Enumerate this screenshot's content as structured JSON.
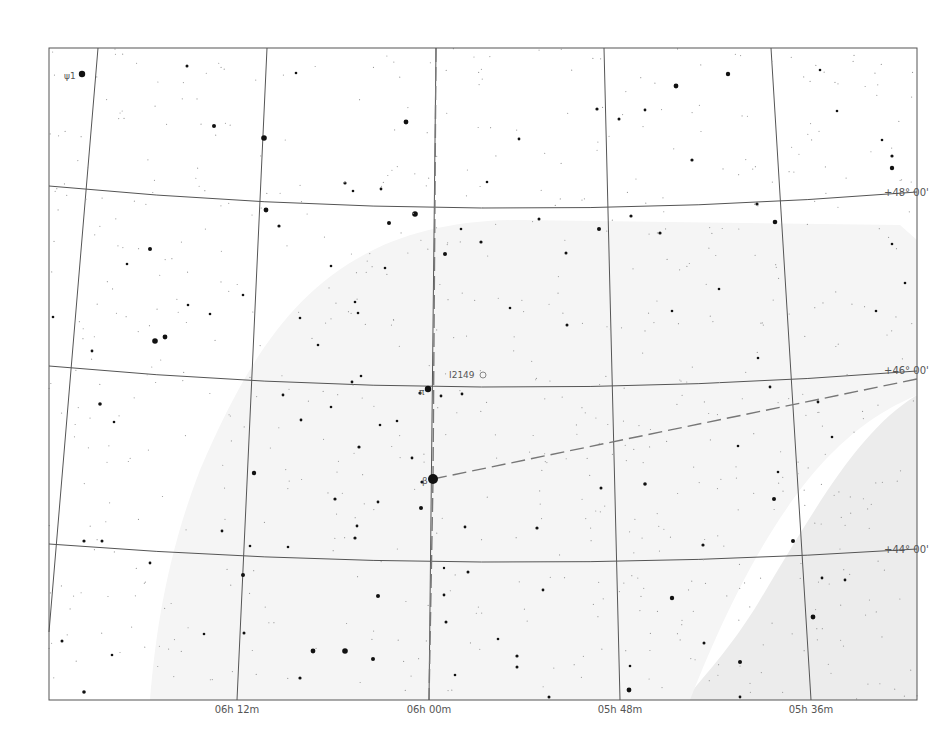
{
  "chart": {
    "frame": {
      "x": 49,
      "y": 48,
      "width": 868,
      "height": 652
    },
    "colors": {
      "background": "#ffffff",
      "milky_way": "#ececec",
      "milky_way_faint": "#f5f5f5",
      "grid": "#555555",
      "constellation": "#777777",
      "star": "#111111",
      "label": "#555555"
    },
    "ra_lines": [
      {
        "label": "06h 12m",
        "top": [
          98,
          48
        ],
        "bottom": [
          64,
          64
        ],
        "label_x": 237,
        "bx": 237
      },
      {
        "label": "",
        "top": [
          98,
          48
        ],
        "bottom": [
          49,
          632
        ]
      },
      {
        "label": "06h 12m",
        "top": [
          267,
          48
        ],
        "bottom": [
          237,
          700
        ]
      },
      {
        "label": "06h 00m",
        "top": [
          436,
          48
        ],
        "bottom": [
          429,
          700
        ]
      },
      {
        "label": "05h 48m",
        "top": [
          604,
          48
        ],
        "bottom": [
          620,
          700
        ]
      },
      {
        "label": "05h 36m",
        "top": [
          771,
          48
        ],
        "bottom": [
          811,
          700
        ]
      }
    ],
    "ra_labels": [
      {
        "text": "06h 12m",
        "x": 237,
        "y": 713
      },
      {
        "text": "06h 00m",
        "x": 429,
        "y": 713
      },
      {
        "text": "05h 48m",
        "x": 620,
        "y": 713
      },
      {
        "text": "05h 36m",
        "x": 811,
        "y": 713
      }
    ],
    "dec_lines": [
      {
        "label": "+48° 00'",
        "left_y": 186,
        "mid_y": 208,
        "right_y": 192
      },
      {
        "label": "+46° 00'",
        "left_y": 366,
        "mid_y": 387,
        "right_y": 371
      },
      {
        "label": "+44° 00'",
        "left_y": 544,
        "mid_y": 562,
        "right_y": 549
      }
    ],
    "dec_labels": [
      {
        "text": "+48° 00'",
        "x": 884,
        "y": 196
      },
      {
        "text": "+46° 00'",
        "x": 884,
        "y": 374
      },
      {
        "text": "+44° 00'",
        "x": 884,
        "y": 553
      }
    ],
    "object_labels": [
      {
        "name": "star-label-psi1",
        "text": "ψ1",
        "x": 64,
        "y": 79
      },
      {
        "name": "star-label-beta",
        "text": "β",
        "x": 422,
        "y": 484
      },
      {
        "name": "star-label-pi",
        "text": "π",
        "x": 419,
        "y": 395
      },
      {
        "name": "dso-label-ic2149",
        "text": "I2149",
        "x": 449,
        "y": 378
      }
    ],
    "constellation_line": {
      "from": [
        433,
        479
      ],
      "to": [
        917,
        379
      ]
    },
    "stars": [
      [
        82,
        74,
        3.2
      ],
      [
        264,
        138,
        2.8
      ],
      [
        214,
        126,
        2.0
      ],
      [
        187,
        66,
        1.5
      ],
      [
        406,
        122,
        2.4
      ],
      [
        345,
        183,
        1.6
      ],
      [
        296,
        73,
        1.3
      ],
      [
        150,
        249,
        2.0
      ],
      [
        155,
        341,
        2.8
      ],
      [
        165,
        337,
        2.4
      ],
      [
        92,
        351,
        1.4
      ],
      [
        266,
        210,
        2.4
      ],
      [
        279,
        226,
        1.6
      ],
      [
        389,
        223,
        2.0
      ],
      [
        415,
        214,
        2.8
      ],
      [
        445,
        254,
        2.0
      ],
      [
        481,
        242,
        1.6
      ],
      [
        566,
        253,
        1.5
      ],
      [
        599,
        229,
        2.0
      ],
      [
        676,
        86,
        2.4
      ],
      [
        728,
        74,
        2.2
      ],
      [
        692,
        160,
        1.6
      ],
      [
        619,
        119,
        1.5
      ],
      [
        892,
        156,
        1.6
      ],
      [
        892,
        168,
        2.2
      ],
      [
        660,
        233,
        1.6
      ],
      [
        775,
        222,
        2.3
      ],
      [
        757,
        204,
        1.6
      ],
      [
        631,
        216,
        1.6
      ],
      [
        539,
        219,
        1.5
      ],
      [
        428,
        389,
        3.2
      ],
      [
        420,
        393,
        1.6
      ],
      [
        441,
        396,
        1.4
      ],
      [
        462,
        394,
        1.4
      ],
      [
        433,
        479,
        5.0
      ],
      [
        100,
        404,
        1.8
      ],
      [
        254,
        473,
        2.2
      ],
      [
        301,
        420,
        1.4
      ],
      [
        359,
        447,
        1.6
      ],
      [
        412,
        458,
        1.4
      ],
      [
        422,
        482,
        1.6
      ],
      [
        421,
        508,
        2.0
      ],
      [
        537,
        528,
        1.6
      ],
      [
        601,
        488,
        1.5
      ],
      [
        645,
        484,
        1.8
      ],
      [
        672,
        598,
        2.2
      ],
      [
        704,
        643,
        1.5
      ],
      [
        774,
        499,
        2.0
      ],
      [
        793,
        541,
        2.0
      ],
      [
        813,
        617,
        2.4
      ],
      [
        740,
        662,
        2.0
      ],
      [
        845,
        580,
        1.4
      ],
      [
        629,
        690,
        2.4
      ],
      [
        549,
        697,
        1.5
      ],
      [
        517,
        656,
        1.6
      ],
      [
        465,
        527,
        1.4
      ],
      [
        378,
        596,
        2.0
      ],
      [
        373,
        659,
        2.0
      ],
      [
        345,
        651,
        2.8
      ],
      [
        313,
        651,
        2.4
      ],
      [
        300,
        678,
        1.6
      ],
      [
        243,
        575,
        2.0
      ],
      [
        244,
        633,
        1.5
      ],
      [
        84,
        541,
        1.6
      ],
      [
        84,
        692,
        1.8
      ],
      [
        102,
        541,
        1.5
      ],
      [
        62,
        641,
        1.5
      ],
      [
        112,
        655,
        1.3
      ],
      [
        335,
        499,
        1.6
      ],
      [
        355,
        538,
        1.6
      ],
      [
        357,
        526,
        1.4
      ],
      [
        378,
        502,
        1.4
      ],
      [
        468,
        572,
        1.5
      ],
      [
        444,
        595,
        1.4
      ],
      [
        444,
        568,
        1.2
      ],
      [
        446,
        622,
        1.5
      ],
      [
        455,
        675,
        1.3
      ],
      [
        517,
        667,
        1.5
      ],
      [
        498,
        639,
        1.3
      ],
      [
        543,
        590,
        1.4
      ],
      [
        630,
        666,
        1.3
      ],
      [
        703,
        545,
        1.6
      ],
      [
        740,
        697,
        1.4
      ],
      [
        822,
        578,
        1.4
      ],
      [
        892,
        244,
        1.3
      ],
      [
        905,
        283,
        1.3
      ],
      [
        882,
        140,
        1.3
      ],
      [
        837,
        111,
        1.3
      ],
      [
        820,
        70,
        1.3
      ],
      [
        645,
        110,
        1.4
      ],
      [
        597,
        109,
        1.6
      ],
      [
        519,
        139,
        1.4
      ],
      [
        487,
        182,
        1.3
      ],
      [
        381,
        189,
        1.4
      ],
      [
        353,
        191,
        1.3
      ],
      [
        331,
        266,
        1.3
      ],
      [
        358,
        313,
        1.3
      ],
      [
        461,
        229,
        1.3
      ],
      [
        510,
        308,
        1.3
      ],
      [
        567,
        325,
        1.5
      ],
      [
        672,
        311,
        1.3
      ],
      [
        719,
        289,
        1.3
      ],
      [
        758,
        358,
        1.3
      ],
      [
        770,
        387,
        1.4
      ],
      [
        738,
        446,
        1.3
      ],
      [
        778,
        472,
        1.3
      ],
      [
        818,
        402,
        1.4
      ],
      [
        832,
        437,
        1.3
      ],
      [
        876,
        311,
        1.3
      ],
      [
        210,
        314,
        1.3
      ],
      [
        243,
        295,
        1.3
      ],
      [
        188,
        305,
        1.3
      ],
      [
        127,
        264,
        1.3
      ],
      [
        114,
        422,
        1.3
      ],
      [
        53,
        317,
        1.3
      ],
      [
        222,
        531,
        1.4
      ],
      [
        150,
        563,
        1.4
      ],
      [
        204,
        634,
        1.3
      ],
      [
        250,
        546,
        1.3
      ],
      [
        288,
        547,
        1.3
      ],
      [
        331,
        407,
        1.3
      ],
      [
        352,
        382,
        1.4
      ],
      [
        361,
        376,
        1.3
      ],
      [
        318,
        345,
        1.3
      ],
      [
        283,
        395,
        1.4
      ],
      [
        380,
        425,
        1.3
      ],
      [
        397,
        421,
        1.3
      ],
      [
        385,
        268,
        1.3
      ],
      [
        355,
        302,
        1.3
      ],
      [
        300,
        318,
        1.3
      ]
    ]
  }
}
